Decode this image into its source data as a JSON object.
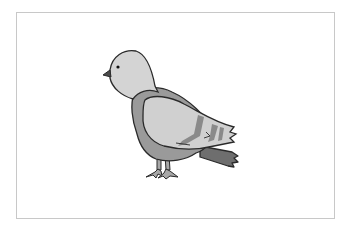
{
  "illustration": {
    "subject": "pigeon",
    "caption": "Pigeon",
    "colors": {
      "background": "#ffffff",
      "frame": "#c8c8c8",
      "outline": "#2a2a2a",
      "head_light": "#d4d4d4",
      "wing_light": "#d0d0d0",
      "body_mid": "#9a9a9a",
      "tail_dark": "#6e6e6e",
      "wing_bar": "#8a8a8a",
      "beak": "#4a4a4a",
      "eye": "#111111",
      "feet": "#a8a8a8"
    }
  }
}
